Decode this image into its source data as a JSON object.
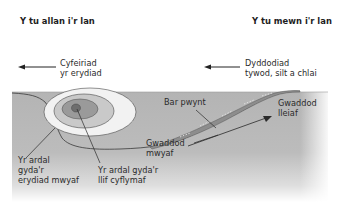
{
  "headers": {
    "left": "Y tu allan i'r lan",
    "right": "Y tu mewn i'r lan"
  },
  "arrows": {
    "erosion_direction": {
      "line1": "Cyfeiriad",
      "line2": "yr erydiad"
    },
    "deposition": {
      "line1": "Dyddodiad",
      "line2": "tywod, silt a chlai"
    }
  },
  "labels": {
    "point_bar": "Bar pwynt",
    "least_sediment": {
      "line1": "Gwaddod",
      "line2": "lleiaf"
    },
    "most_sediment": {
      "line1": "Gwaddod",
      "line2": "mwyaf"
    },
    "most_erosion": {
      "line1": "Yr ardal",
      "line2": "gyda'r",
      "line3": "erydiad mwyaf"
    },
    "fastest_flow": {
      "line1": "Yr ardal gyda'r",
      "line2": "llif cyflymaf"
    }
  },
  "colors": {
    "bank": "#b4b4b4",
    "outer_ring": "#f2f2f2",
    "middle_ring": "#c9c9c9",
    "inner_ring": "#9a9a9a",
    "core": "#6e6e6e",
    "line": "#3a3a3a"
  }
}
